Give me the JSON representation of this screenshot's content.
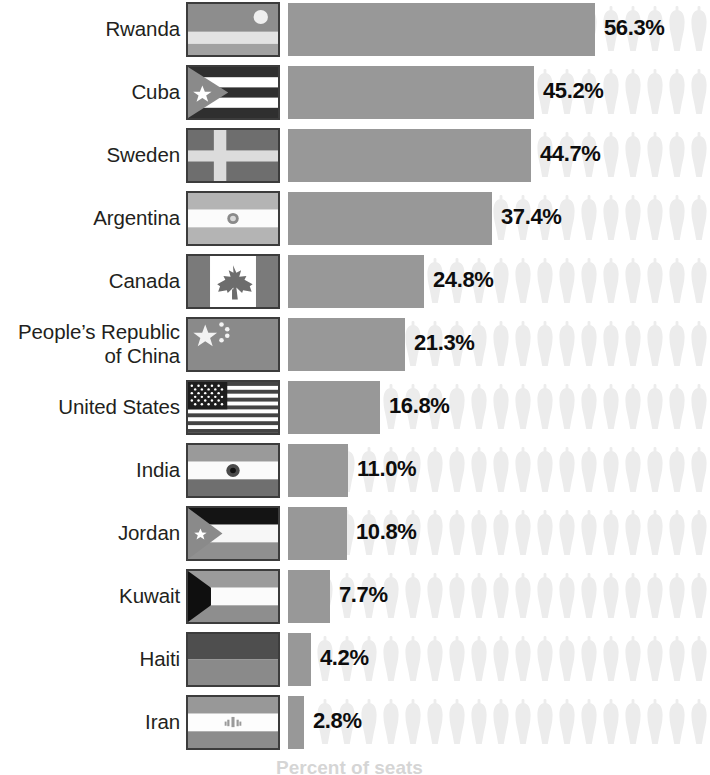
{
  "chart_data": {
    "type": "bar",
    "title": "",
    "subtitle": "",
    "xlabel": "Percent of seats",
    "ylabel": "",
    "orientation": "horizontal",
    "grid": false,
    "legend": "none",
    "xlim": [
      0,
      60
    ],
    "value_suffix": "%",
    "categories": [
      "Rwanda",
      "Cuba",
      "Sweden",
      "Argentina",
      "People’s Republic of China",
      "Canada",
      "United States",
      "India",
      "Jordan",
      "Kuwait",
      "Haiti",
      "Iran"
    ],
    "values": [
      56.3,
      45.2,
      44.7,
      37.4,
      21.3,
      24.8,
      16.8,
      11.0,
      10.8,
      7.7,
      4.2,
      2.8
    ]
  },
  "axis": {
    "caption": "Percent of seats"
  },
  "style": {
    "bar_color": "#989898",
    "icon_color": "#ededed",
    "label_color": "#231f20",
    "value_color": "#0d0d0d",
    "background": "#ffffff",
    "flag_border": "#3c3c3c"
  },
  "rows": [
    {
      "country": "Rwanda",
      "value_label": "56.3%",
      "value": 56.3,
      "flag": "rwanda-flag",
      "two_line": false,
      "bar_px": 307,
      "top": 0
    },
    {
      "country": "Cuba",
      "value_label": "45.2%",
      "value": 45.2,
      "flag": "cuba-flag",
      "two_line": false,
      "bar_px": 246,
      "top": 63
    },
    {
      "country": "Sweden",
      "value_label": "44.7%",
      "value": 44.7,
      "flag": "sweden-flag",
      "two_line": false,
      "bar_px": 243,
      "top": 126
    },
    {
      "country": "Argentina",
      "value_label": "37.4%",
      "value": 37.4,
      "flag": "argentina-flag",
      "two_line": false,
      "bar_px": 204,
      "top": 189
    },
    {
      "country": "Canada",
      "value_label": "24.8%",
      "value": 24.8,
      "flag": "canada-flag",
      "two_line": false,
      "bar_px": 136,
      "top": 252
    },
    {
      "country": "People’s Republic of China",
      "country_line1": "People’s Republic",
      "country_line2": "of China",
      "value_label": "21.3%",
      "value": 21.3,
      "flag": "china-flag",
      "two_line": true,
      "bar_px": 117,
      "top": 315
    },
    {
      "country": "United States",
      "value_label": "16.8%",
      "value": 16.8,
      "flag": "usa-flag",
      "two_line": false,
      "bar_px": 92,
      "top": 378
    },
    {
      "country": "India",
      "value_label": "11.0%",
      "value": 11.0,
      "flag": "india-flag",
      "two_line": false,
      "bar_px": 60,
      "top": 441
    },
    {
      "country": "Jordan",
      "value_label": "10.8%",
      "value": 10.8,
      "flag": "jordan-flag",
      "two_line": false,
      "bar_px": 59,
      "top": 504
    },
    {
      "country": "Kuwait",
      "value_label": "7.7%",
      "value": 7.7,
      "flag": "kuwait-flag",
      "two_line": false,
      "bar_px": 42,
      "top": 567
    },
    {
      "country": "Haiti",
      "value_label": "4.2%",
      "value": 4.2,
      "flag": "haiti-flag",
      "two_line": false,
      "bar_px": 23,
      "top": 630
    },
    {
      "country": "Iran",
      "value_label": "2.8%",
      "value": 2.8,
      "flag": "iran-flag",
      "two_line": false,
      "bar_px": 16,
      "top": 693
    }
  ]
}
